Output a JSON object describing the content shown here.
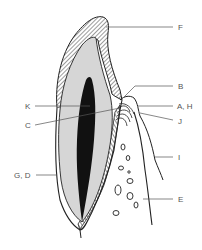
{
  "diagram": {
    "labels": [
      {
        "id": "F",
        "text": "F",
        "x": 178,
        "y": 23
      },
      {
        "id": "B",
        "text": "B",
        "x": 178,
        "y": 83
      },
      {
        "id": "K",
        "text": "K",
        "x": 25,
        "y": 102
      },
      {
        "id": "AH",
        "text": "A, H",
        "x": 177,
        "y": 102
      },
      {
        "id": "C",
        "text": "C",
        "x": 25,
        "y": 121
      },
      {
        "id": "J",
        "text": "J",
        "x": 178,
        "y": 117
      },
      {
        "id": "I",
        "text": "I",
        "x": 178,
        "y": 153
      },
      {
        "id": "GD",
        "text": "G, D",
        "x": 14,
        "y": 171
      },
      {
        "id": "E",
        "text": "E",
        "x": 178,
        "y": 196
      }
    ],
    "colors": {
      "outline": "#222222",
      "dentin": "#d6d6d6",
      "pulp": "#111111",
      "leader": "#555555",
      "background": "#ffffff"
    }
  }
}
